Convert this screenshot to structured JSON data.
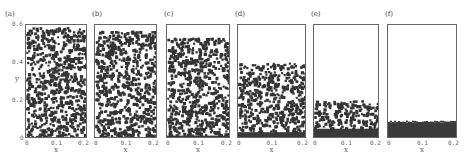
{
  "figure": {
    "panels": [
      {
        "label": "(a)",
        "x": 25,
        "y": 24,
        "w": 62,
        "h": 114,
        "fill_top": 0.0,
        "bed": 0.0
      },
      {
        "label": "(b)",
        "x": 94,
        "y": 24,
        "w": 63,
        "h": 114,
        "fill_top": 0.03,
        "bed": 0.0
      },
      {
        "label": "(c)",
        "x": 166,
        "y": 24,
        "w": 64,
        "h": 114,
        "fill_top": 0.09,
        "bed": 0.03
      },
      {
        "label": "(d)",
        "x": 237,
        "y": 24,
        "w": 69,
        "h": 114,
        "fill_top": 0.31,
        "bed": 0.06
      },
      {
        "label": "(e)",
        "x": 313,
        "y": 24,
        "w": 66,
        "h": 114,
        "fill_top": 0.64,
        "bed": 0.09
      },
      {
        "label": "(f)",
        "x": 387,
        "y": 24,
        "w": 70,
        "h": 114,
        "fill_top": 0.86,
        "bed": 0.14
      }
    ],
    "y_axis": {
      "label": "y",
      "ticks": [
        "0",
        "0.2",
        "0.4",
        "0.6"
      ]
    },
    "x_axis": {
      "label": "x",
      "ticks": [
        "0",
        "0.1",
        "0.2"
      ]
    },
    "particle_color": "#333333"
  }
}
